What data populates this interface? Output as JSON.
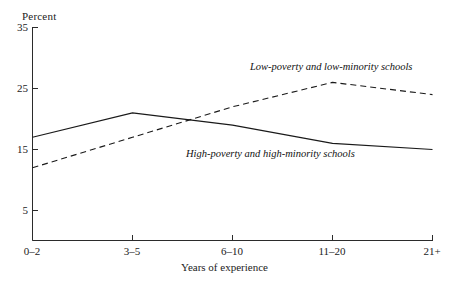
{
  "chart_data": {
    "type": "line",
    "title": "",
    "xlabel": "Years of experience",
    "ylabel": "Percent",
    "categories": [
      "0–2",
      "3–5",
      "6–10",
      "11–20",
      "21+"
    ],
    "ylim": [
      0,
      35
    ],
    "yticks": [
      5,
      15,
      25,
      35
    ],
    "ytick_labels": [
      "5",
      "15",
      "25",
      "35"
    ],
    "grid": false,
    "legend_position": "inline-annotations",
    "series": [
      {
        "name": "High-poverty and high-minority schools",
        "style": "solid",
        "color": "#1a1a1a",
        "values": [
          17,
          21,
          19,
          16,
          15
        ]
      },
      {
        "name": "Low-poverty and low-minority schools",
        "style": "dashed",
        "color": "#1a1a1a",
        "values": [
          12,
          17,
          22,
          26,
          24
        ]
      }
    ],
    "annotations": [
      {
        "text": "Low-poverty and low-minority schools",
        "x_px": 250,
        "y_px": 61
      },
      {
        "text": "High-poverty and high-minority schools",
        "x_px": 186,
        "y_px": 148
      }
    ]
  },
  "axes": {
    "y_title": "Percent",
    "x_title": "Years of experience",
    "y_tick_labels": [
      "35",
      "25",
      "15",
      "5"
    ],
    "x_tick_labels": [
      "0–2",
      "3–5",
      "6–10",
      "11–20",
      "21+"
    ]
  },
  "series_labels": {
    "low": "Low-poverty and low-minority schools",
    "high": "High-poverty and high-minority schools"
  }
}
